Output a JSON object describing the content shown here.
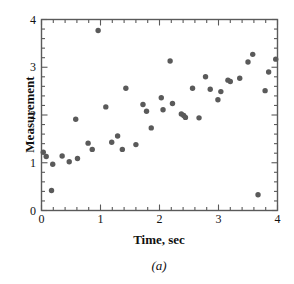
{
  "figure": {
    "caption": "(a)",
    "background": "#ffffff"
  },
  "chart_data": {
    "type": "scatter",
    "title": "",
    "subtitle": "",
    "caption": "(a)",
    "xlabel": "Time, sec",
    "ylabel": "Measurement",
    "xlim": [
      0,
      4
    ],
    "ylim": [
      0,
      4
    ],
    "xticks": [
      0,
      1,
      2,
      3,
      4
    ],
    "yticks": [
      0,
      1,
      2,
      3,
      4
    ],
    "xtick_labels": [
      "0",
      "1",
      "2",
      "3",
      "4"
    ],
    "ytick_labels": [
      "0",
      "1",
      "2",
      "3",
      "4"
    ],
    "minor_tick_step": 0.2,
    "grid": false,
    "legend": null,
    "marker": {
      "shape": "circle",
      "color": "#5a5a5a",
      "size_px": 5.4
    },
    "axis_color": "#5a5a5a",
    "series": [
      {
        "name": "Measurement vs Time",
        "points": [
          [
            0.03,
            1.22
          ],
          [
            0.08,
            1.13
          ],
          [
            0.17,
            0.42
          ],
          [
            0.19,
            0.97
          ],
          [
            0.35,
            1.14
          ],
          [
            0.47,
            1.02
          ],
          [
            0.58,
            1.91
          ],
          [
            0.61,
            1.09
          ],
          [
            0.79,
            1.41
          ],
          [
            0.86,
            1.28
          ],
          [
            0.96,
            3.77
          ],
          [
            1.09,
            2.17
          ],
          [
            1.19,
            1.43
          ],
          [
            1.29,
            1.56
          ],
          [
            1.37,
            1.28
          ],
          [
            1.43,
            2.56
          ],
          [
            1.6,
            1.38
          ],
          [
            1.72,
            2.22
          ],
          [
            1.78,
            2.08
          ],
          [
            1.86,
            1.73
          ],
          [
            2.03,
            2.36
          ],
          [
            2.06,
            2.11
          ],
          [
            2.18,
            3.13
          ],
          [
            2.22,
            2.24
          ],
          [
            2.37,
            2.02
          ],
          [
            2.41,
            1.99
          ],
          [
            2.44,
            1.95
          ],
          [
            2.56,
            2.56
          ],
          [
            2.67,
            1.94
          ],
          [
            2.78,
            2.8
          ],
          [
            2.86,
            2.54
          ],
          [
            2.99,
            2.32
          ],
          [
            3.04,
            2.49
          ],
          [
            3.16,
            2.73
          ],
          [
            3.2,
            2.7
          ],
          [
            3.36,
            2.77
          ],
          [
            3.5,
            3.11
          ],
          [
            3.58,
            3.27
          ],
          [
            3.67,
            0.33
          ],
          [
            3.79,
            2.51
          ],
          [
            3.85,
            2.9
          ],
          [
            3.97,
            3.17
          ]
        ]
      }
    ]
  },
  "axes": {
    "x_title": "Time, sec",
    "y_title": "Measurement"
  }
}
